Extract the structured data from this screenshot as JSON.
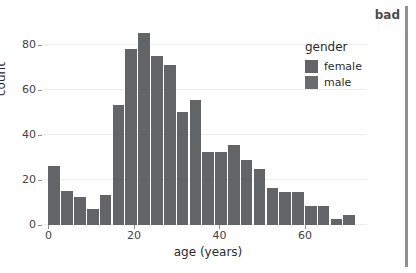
{
  "chart_data": {
    "type": "bar",
    "title": "",
    "subtitle": "",
    "xlabel": "age (years)",
    "ylabel": "count",
    "xlim": [
      -1.5,
      74.5
    ],
    "ylim": [
      0,
      90
    ],
    "xticks": [
      0,
      20,
      40,
      60
    ],
    "yticks": [
      0,
      20,
      40,
      60,
      80
    ],
    "grid": "horizontal",
    "bin_width": 3,
    "categories": [
      "0-3",
      "3-6",
      "6-9",
      "9-12",
      "12-15",
      "15-18",
      "18-21",
      "21-24",
      "24-27",
      "27-30",
      "30-33",
      "33-36",
      "36-39",
      "39-42",
      "42-45",
      "45-48",
      "48-51",
      "51-54",
      "54-57",
      "57-60",
      "60-63",
      "63-66",
      "66-69",
      "69-72"
    ],
    "x": [
      1.5,
      4.5,
      7.5,
      10.5,
      13.5,
      16.5,
      19.5,
      22.5,
      25.5,
      28.5,
      31.5,
      34.5,
      37.5,
      40.5,
      43.5,
      46.5,
      49.5,
      52.5,
      55.5,
      58.5,
      61.5,
      64.5,
      67.5,
      70.5
    ],
    "values": [
      26,
      15,
      12.5,
      7,
      13.5,
      53,
      78,
      85,
      75,
      71,
      50,
      55.5,
      32.5,
      32.5,
      35.5,
      29,
      25,
      16.5,
      14.5,
      14.5,
      8.5,
      8.5,
      2.5,
      4.5
    ],
    "series": [
      {
        "name": "all",
        "values": [
          26,
          15,
          12.5,
          7,
          13.5,
          53,
          78,
          85,
          75,
          71,
          50,
          55.5,
          32.5,
          32.5,
          35.5,
          29,
          25,
          16.5,
          14.5,
          14.5,
          8.5,
          8.5,
          2.5,
          4.5
        ]
      }
    ],
    "legend": {
      "position": "right-inside",
      "title": "gender",
      "entries": [
        {
          "label": "female",
          "color": "#636466"
        },
        {
          "label": "male",
          "color": "#6a6b6d"
        }
      ]
    },
    "annotations": [
      {
        "text": "bad",
        "position": "top-right",
        "color": "#4a4b4e"
      }
    ],
    "colors": {
      "bar": "#636466",
      "grid": "#ececed",
      "text": "#2b2c2f",
      "tick": "#8e9093",
      "annotation_rule": "#8e9093",
      "background": "#ffffff"
    }
  }
}
